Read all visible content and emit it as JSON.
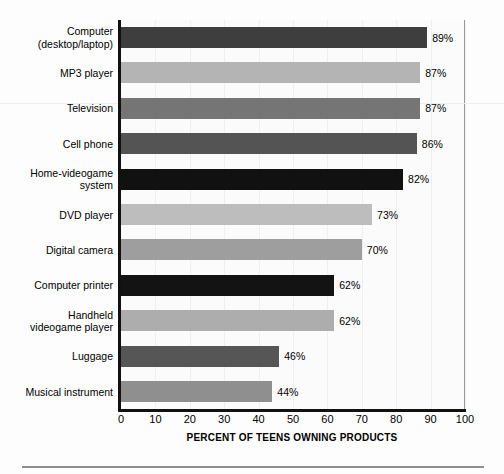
{
  "chart_data": {
    "type": "bar",
    "orientation": "horizontal",
    "title": "",
    "xlabel": "PERCENT OF TEENS OWNING PRODUCTS",
    "ylabel": "",
    "xlim": [
      0,
      100
    ],
    "xticks": [
      0,
      10,
      20,
      30,
      40,
      50,
      60,
      70,
      80,
      90,
      100
    ],
    "grid": "vertical-faint",
    "legend": "none",
    "value_suffix": "%",
    "categories": [
      "Computer\n(desktop/laptop)",
      "MP3 player",
      "Television",
      "Cell phone",
      "Home-videogame\nsystem",
      "DVD player",
      "Digital camera",
      "Computer printer",
      "Handheld\nvideogame player",
      "Luggage",
      "Musical instrument"
    ],
    "values": [
      89,
      87,
      87,
      86,
      82,
      73,
      70,
      62,
      62,
      46,
      44
    ],
    "value_labels": [
      "89%",
      "87%",
      "87%",
      "86%",
      "82%",
      "73%",
      "70%",
      "62%",
      "62%",
      "46%",
      "44%"
    ],
    "bar_colors": [
      "#3e3e3e",
      "#b4b4b4",
      "#757575",
      "#545454",
      "#111111",
      "#bdbdbd",
      "#9e9e9e",
      "#131313",
      "#adadad",
      "#565656",
      "#8f8f8f"
    ]
  },
  "axis": {
    "tick_labels": [
      "0",
      "10",
      "20",
      "30",
      "40",
      "50",
      "60",
      "70",
      "80",
      "90",
      "100"
    ],
    "title": "PERCENT OF TEENS OWNING PRODUCTS"
  },
  "colors": {
    "axis": "#111111",
    "frame": "#9a9a9a",
    "background": "#fdfdfd",
    "grid": "#efefef",
    "rule": "#8e8e8e"
  }
}
